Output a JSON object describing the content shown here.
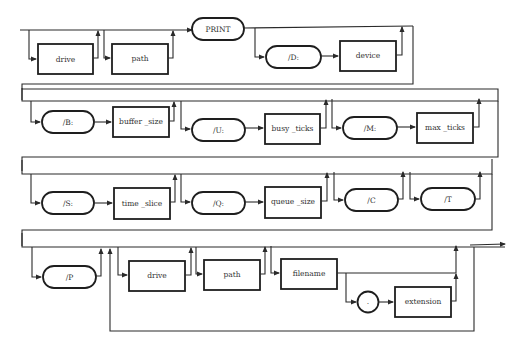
{
  "diagram": {
    "type": "syntax-railroad",
    "command": "PRINT",
    "rows": [
      {
        "row": 1,
        "elements": [
          {
            "kind": "nonterminal",
            "label": "drive",
            "optional": true
          },
          {
            "kind": "nonterminal",
            "label": "path",
            "optional": true
          },
          {
            "kind": "terminal",
            "label": "PRINT"
          },
          {
            "kind": "terminal",
            "label": "/D:",
            "optional_group": "D"
          },
          {
            "kind": "nonterminal",
            "label": "device",
            "optional_group": "D"
          }
        ]
      },
      {
        "row": 2,
        "elements": [
          {
            "kind": "terminal",
            "label": "/B:",
            "optional_group": "B"
          },
          {
            "kind": "nonterminal",
            "label": "buffer_size",
            "optional_group": "B"
          },
          {
            "kind": "terminal",
            "label": "/U:",
            "optional_group": "U"
          },
          {
            "kind": "nonterminal",
            "label": "busy_ticks",
            "optional_group": "U"
          },
          {
            "kind": "terminal",
            "label": "/M:",
            "optional_group": "M"
          },
          {
            "kind": "nonterminal",
            "label": "max_ticks",
            "optional_group": "M"
          }
        ]
      },
      {
        "row": 3,
        "elements": [
          {
            "kind": "terminal",
            "label": "/S:",
            "optional_group": "S"
          },
          {
            "kind": "nonterminal",
            "label": "time_slice",
            "optional_group": "S"
          },
          {
            "kind": "terminal",
            "label": "/Q:",
            "optional_group": "Q"
          },
          {
            "kind": "nonterminal",
            "label": "queue_size",
            "optional_group": "Q"
          },
          {
            "kind": "terminal",
            "label": "/C",
            "optional": true
          },
          {
            "kind": "terminal",
            "label": "/T",
            "optional": true
          }
        ]
      },
      {
        "row": 4,
        "elements": [
          {
            "kind": "terminal",
            "label": "/P",
            "optional": true
          },
          {
            "kind": "nonterminal",
            "label": "drive",
            "optional": true,
            "repeatable_group": "file"
          },
          {
            "kind": "nonterminal",
            "label": "path",
            "optional": true,
            "repeatable_group": "file"
          },
          {
            "kind": "nonterminal",
            "label": "filename",
            "repeatable_group": "file"
          },
          {
            "kind": "terminal",
            "label": ".",
            "optional_group": "ext",
            "shape": "circle"
          },
          {
            "kind": "nonterminal",
            "label": "extension",
            "optional_group": "ext"
          }
        ]
      }
    ]
  },
  "labels": {
    "r1_drive": "drive",
    "r1_path": "path",
    "print": "PRINT",
    "d_switch": "/D:",
    "device": "device",
    "b_switch": "/B:",
    "buffer_size": "buffer _size",
    "u_switch": "/U:",
    "busy_ticks": "busy _ticks",
    "m_switch": "/M:",
    "max_ticks": "max _ticks",
    "s_switch": "/S:",
    "time_slice": "time _slice",
    "q_switch": "/Q:",
    "queue_size": "queue _size",
    "c_switch": "/C",
    "t_switch": "/T",
    "p_switch": "/P",
    "r4_drive": "drive",
    "r4_path": "path",
    "filename": "filename",
    "dot": ".",
    "extension": "extension"
  }
}
